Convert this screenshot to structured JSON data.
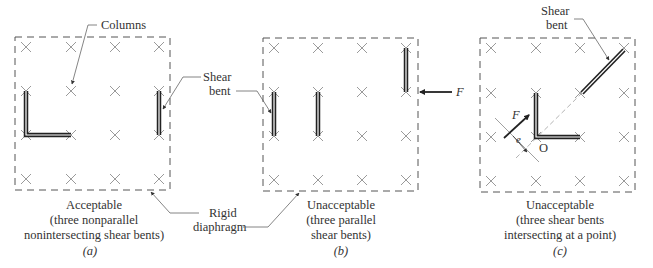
{
  "figure": {
    "labels": {
      "columns": "Columns",
      "shear_bent_a_line1": "Shear",
      "shear_bent_a_line2": "bent",
      "rigid_line1": "Rigid",
      "rigid_line2": "diaphragm",
      "force_b": "F",
      "shear_bent_c_line1": "Shear",
      "shear_bent_c_line2": "bent",
      "force_c": "F",
      "eccentricity": "e",
      "origin": "O"
    },
    "panels": [
      {
        "id": "a",
        "caption_lines": [
          "Acceptable",
          "(three nonparallel",
          "nonintersecting shear bents)"
        ],
        "tag": "(a)"
      },
      {
        "id": "b",
        "caption_lines": [
          "Unacceptable",
          "(three parallel",
          "shear bents)"
        ],
        "tag": "(b)"
      },
      {
        "id": "c",
        "caption_lines": [
          "Unacceptable",
          "(three shear bents",
          "intersecting at a point)"
        ],
        "tag": "(c)"
      }
    ],
    "colors": {
      "outline": "#555555",
      "column_mark": "#9a9a9a",
      "bent": "#222222",
      "leader": "#666666",
      "text": "#333333"
    }
  }
}
